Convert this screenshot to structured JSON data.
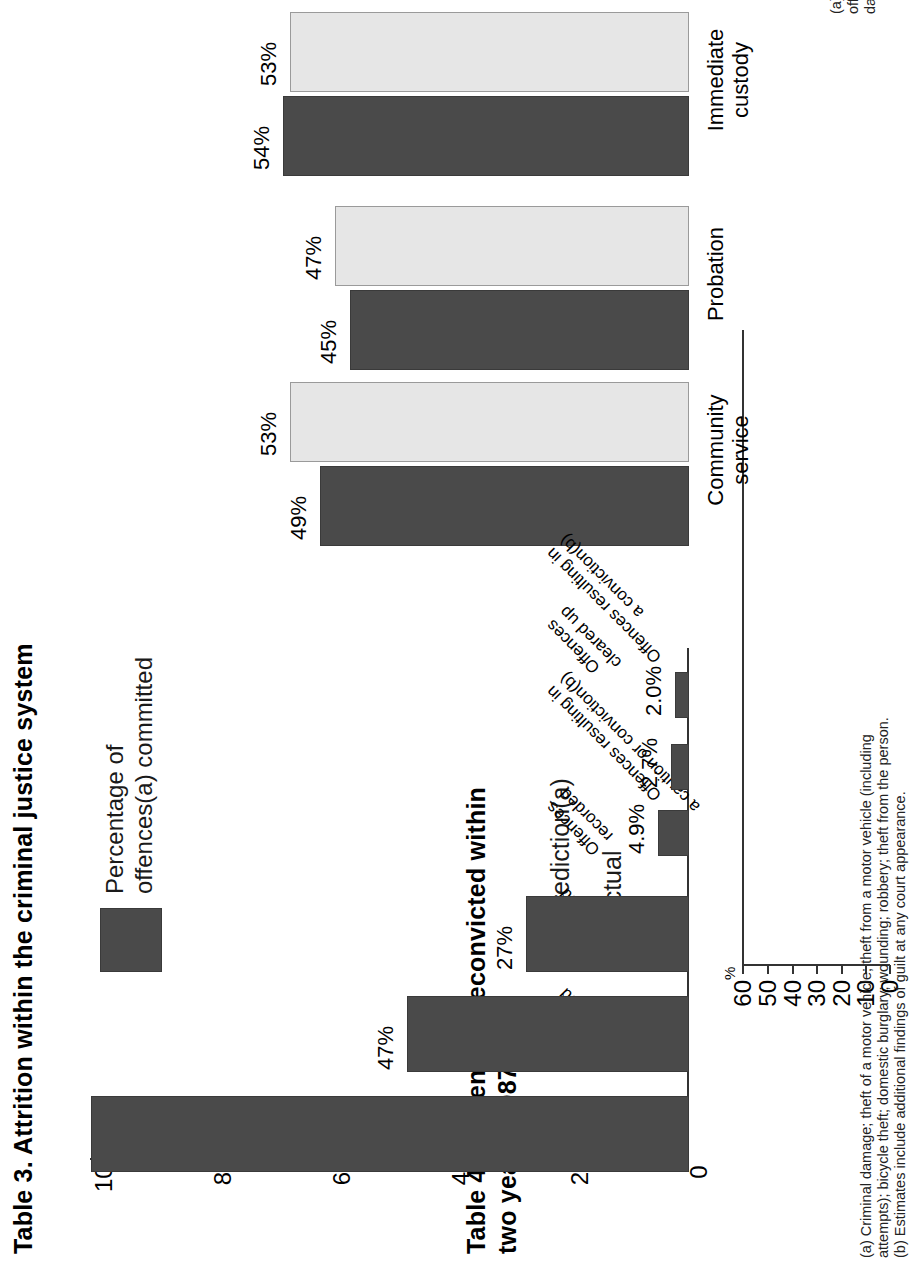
{
  "page": {
    "background": "#ffffff",
    "orientation": "rotated-90-ccw"
  },
  "figures": {
    "table4": {
      "title": "Table 4.  Percentage  reconvicted within\ntwo years, 1987",
      "axis_unit": "%",
      "legend": {
        "pred_label": "Prediction(a)",
        "actual_label": "Actual"
      },
      "note": "(a) Prediction rates were calculated from offender's age, sex,\noffence and criminal history by fitting a statistical model to all data.",
      "colors": {
        "actual": "#4a4a4a",
        "prediction": "#e9e9e9"
      }
    },
    "table3": {
      "title": "Table 3.  Attrition within the criminal justice system",
      "legend": {
        "label": "Percentage of\noffences(a) committed"
      },
      "note": "(a) Criminal damage; theft of a motor vehicle; theft from a motor vehicle (including\nattempts); bicycle theft; domestic burglary; wounding; robbery; theft from the person.\n(b) Estimates include additional findings of guilt at any court appearance.",
      "colors": {
        "bar": "#4a4a4a"
      }
    }
  },
  "chart_data": [
    {
      "id": "table4",
      "type": "bar",
      "title": "Table 4.  Percentage  reconvicted within two years, 1987",
      "xlabel": "",
      "ylabel": "%",
      "ylim": [
        0,
        60
      ],
      "yticks": [
        0,
        10,
        20,
        30,
        40,
        50,
        60
      ],
      "ytick_labels": [
        "0",
        "10",
        "20",
        "30",
        "40",
        "50",
        "60"
      ],
      "grid": false,
      "legend_position": "top-left",
      "categories": [
        "Immediate\ncustody",
        "Probation",
        "Community\nservice"
      ],
      "series": [
        {
          "name": "Actual",
          "values": [
            54,
            45,
            49
          ],
          "labels": [
            "54%",
            "45%",
            "49%"
          ],
          "color": "#4a4a4a"
        },
        {
          "name": "Prediction(a)",
          "values": [
            53,
            47,
            53
          ],
          "labels": [
            "53%",
            "47%",
            "53%"
          ],
          "color": "#e9e9e9"
        }
      ],
      "annotations": [
        "(a) Prediction rates were calculated from offender's age, sex, offence and criminal history by fitting a statistical model to all data."
      ]
    },
    {
      "id": "table3",
      "type": "bar",
      "title": "Table 3.  Attrition within the criminal justice system",
      "xlabel": "",
      "ylabel": "",
      "ylim": [
        0,
        100
      ],
      "yticks": [
        0,
        20,
        40,
        60,
        80,
        100
      ],
      "ytick_labels": [
        "0",
        "20",
        "40",
        "60",
        "80",
        "100"
      ],
      "grid": false,
      "legend_position": "top-center",
      "categories": [
        "Offences\ncommitted",
        "Offences\nreported",
        "Offences\nrecorded",
        "Offences resulting in\na caution or conviction(b)",
        "Offences\ncleared up",
        "Offences resulting in\na conviction(b)"
      ],
      "series": [
        {
          "name": "Percentage of offences(a) committed",
          "values": [
            100,
            47,
            27,
            4.9,
            2.7,
            2.0
          ],
          "labels": [
            "",
            "47%",
            "27%",
            "4.9%",
            "2.7%",
            "2.0%"
          ],
          "color": "#4a4a4a"
        }
      ],
      "annotations": [
        "(a) Criminal damage; theft of a motor vehicle; theft from a motor vehicle (including attempts); bicycle theft; domestic burglary; wounding; robbery; theft from the person.",
        "(b) Estimates include additional findings of guilt at any court appearance."
      ]
    }
  ]
}
